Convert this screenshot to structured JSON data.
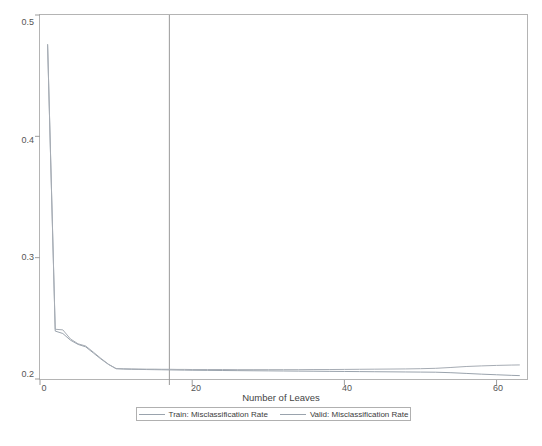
{
  "chart_data": {
    "type": "line",
    "title": "",
    "xlabel": "Number of Leaves",
    "ylabel": "",
    "xlim": [
      0,
      64
    ],
    "ylim": [
      0.2,
      0.5
    ],
    "grid": false,
    "legend_position": "bottom",
    "xticks": [
      0,
      20,
      40,
      60
    ],
    "xtick_labels": [
      "0",
      "20",
      "40",
      "60"
    ],
    "yticks": [
      0.2,
      0.3,
      0.4,
      0.5
    ],
    "ytick_labels": [
      "0.2",
      "0.3",
      "0.4",
      "0.5"
    ],
    "annotations": [
      {
        "name": "selected-leaves-reference-line",
        "type": "vline",
        "x": 17,
        "label": ""
      }
    ],
    "x": [
      1,
      2,
      3,
      4,
      5,
      6,
      7,
      8,
      9,
      10,
      11,
      12,
      13,
      14,
      15,
      16,
      17,
      18,
      19,
      20,
      22,
      24,
      26,
      28,
      30,
      32,
      34,
      36,
      38,
      40,
      42,
      44,
      46,
      48,
      50,
      52,
      54,
      56,
      58,
      60,
      62,
      63
    ],
    "series": [
      {
        "name": "Train: Misclassification Rate",
        "color": "#9aa3ad",
        "values": [
          0.4755,
          0.2395,
          0.2375,
          0.232,
          0.2285,
          0.2265,
          0.2215,
          0.2165,
          0.212,
          0.2085,
          0.2082,
          0.208,
          0.2079,
          0.2078,
          0.2077,
          0.2076,
          0.2075,
          0.2074,
          0.2073,
          0.2072,
          0.2071,
          0.207,
          0.2069,
          0.2068,
          0.2067,
          0.2066,
          0.2065,
          0.2064,
          0.2063,
          0.2062,
          0.2061,
          0.206,
          0.2059,
          0.2058,
          0.2057,
          0.2056,
          0.2052,
          0.2046,
          0.204,
          0.2035,
          0.203,
          0.2028
        ]
      },
      {
        "name": "Valid: Misclassification Rate",
        "color": "#a6acb4",
        "values": [
          0.4755,
          0.241,
          0.2405,
          0.233,
          0.229,
          0.2272,
          0.2222,
          0.217,
          0.2122,
          0.2086,
          0.2084,
          0.2083,
          0.2082,
          0.2081,
          0.2081,
          0.208,
          0.208,
          0.2079,
          0.2079,
          0.2078,
          0.2078,
          0.2078,
          0.2077,
          0.2077,
          0.2077,
          0.2077,
          0.2077,
          0.2078,
          0.2078,
          0.2079,
          0.208,
          0.2081,
          0.2082,
          0.2083,
          0.2085,
          0.2088,
          0.2095,
          0.2103,
          0.2108,
          0.2112,
          0.2115,
          0.2116
        ]
      }
    ]
  }
}
